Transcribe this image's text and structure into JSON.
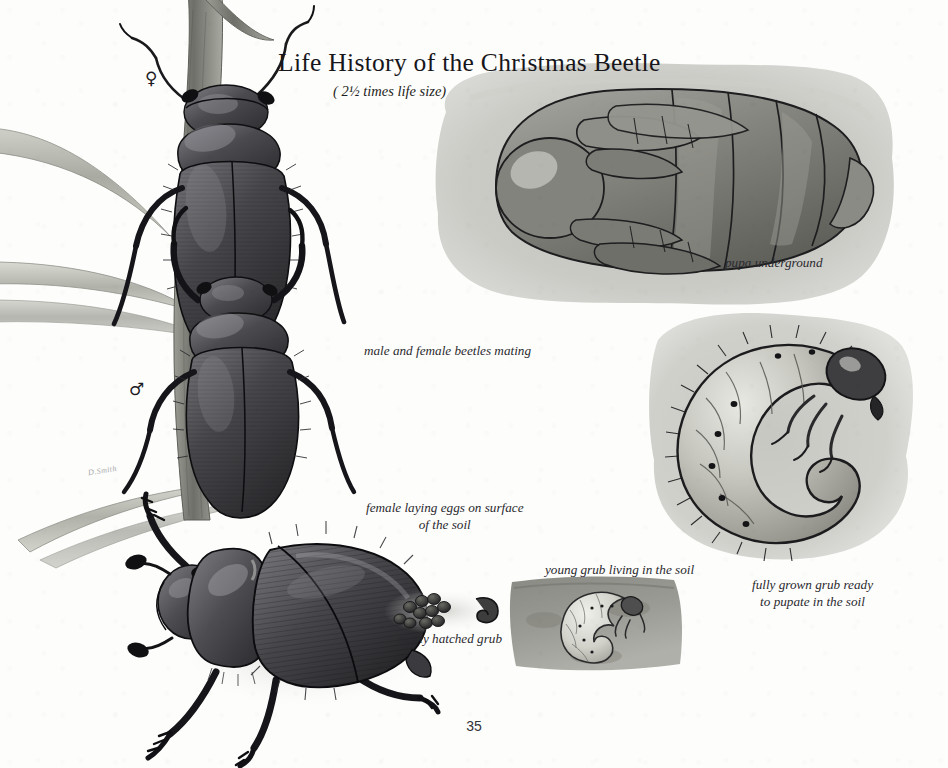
{
  "page": {
    "title": "Life History of the Christmas Beetle",
    "subtitle": "( 2½ times life size)",
    "page_number": "35",
    "signature": "D.Smith"
  },
  "symbols": {
    "female": "♀",
    "male": "♂"
  },
  "captions": {
    "mating": "male and female beetles mating",
    "laying_eggs": "female laying eggs on surface\nof the soil",
    "pupa": "pupa underground",
    "fully_grown_grub": "fully grown grub ready\nto pupate in the soil",
    "young_grub": "young grub living in the soil",
    "newly_hatched": "newly hatched grub"
  },
  "figures": [
    {
      "id": "mating-beetles",
      "label": "male and female beetles mating"
    },
    {
      "id": "pupa",
      "label": "pupa underground"
    },
    {
      "id": "fully-grown-grub",
      "label": "fully grown grub ready to pupate in the soil"
    },
    {
      "id": "adult-beetle",
      "label": "female laying eggs on surface of the soil"
    },
    {
      "id": "eggs",
      "label": "newly hatched grub"
    },
    {
      "id": "young-grub",
      "label": "young grub living in the soil"
    }
  ],
  "colors": {
    "paper": "#fdfdfc",
    "ink": "#17161a",
    "beetle_dark": "#3a3a3e",
    "beetle_shadow": "#1d1d20",
    "wash_grey": "#b9b9b4",
    "soil_dark": "#8e8e88",
    "grass_grey": "#b4b5ad",
    "grub_pale": "#d8d7d0"
  }
}
